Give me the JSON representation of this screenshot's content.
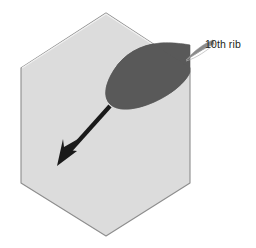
{
  "figure": {
    "background_color": "#ffffff"
  },
  "shapes": {
    "block": {
      "name": "hexagonal meat block",
      "fill_color": "#dcdcdc",
      "stroke_color": "#8d8d8d",
      "vertices": [
        [
          106,
          13
        ],
        [
          190,
          68
        ],
        [
          190,
          183
        ],
        [
          106,
          236
        ],
        [
          21,
          183
        ],
        [
          21,
          68
        ]
      ]
    },
    "rib_region": {
      "name": "10th rib cross section",
      "fill_color": "#595959",
      "stroke_color": "#595959"
    },
    "arrow": {
      "name": "direction arrow",
      "color": "#1a1a1a",
      "start": [
        110,
        107
      ],
      "tip": [
        57,
        166
      ]
    },
    "leader": {
      "name": "label leader line",
      "color": "#6e6e6e"
    }
  },
  "labels": {
    "rib": "10th rib"
  }
}
